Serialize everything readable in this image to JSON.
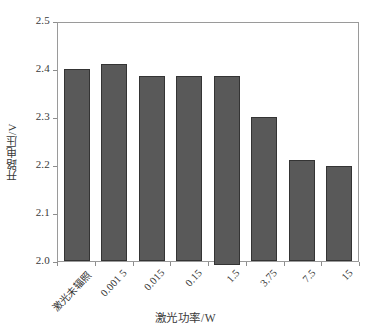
{
  "chart_data": {
    "type": "bar",
    "title": "",
    "subtitle": "",
    "xlabel": "激光功率/W",
    "ylabel": "开路电压/V",
    "categories": [
      "激光未辐照",
      "0.001 5",
      "0.015",
      "0.15",
      "1.5",
      "3.75",
      "7.5",
      "15"
    ],
    "values": [
      2.4,
      2.41,
      2.385,
      2.385,
      2.385,
      2.3,
      2.21,
      2.198
    ],
    "series": [
      {
        "name": "开路电压",
        "values": [
          2.4,
          2.41,
          2.385,
          2.385,
          2.385,
          2.3,
          2.21,
          2.198
        ]
      }
    ],
    "ylim": [
      2.0,
      2.5
    ],
    "yticks": [
      "2.0",
      "2.1",
      "2.2",
      "2.3",
      "2.4",
      "2.5"
    ],
    "ytick_values": [
      2.0,
      2.1,
      2.2,
      2.3,
      2.4,
      2.5
    ],
    "grid": false,
    "legend": null,
    "legend_position": "none",
    "annotations": [],
    "bar_color": "#595959",
    "bar_edge_color": "#343434",
    "axis_color": "#9a9a9a",
    "background_color": "#ffffff",
    "xtick_label_rotation": -47
  }
}
